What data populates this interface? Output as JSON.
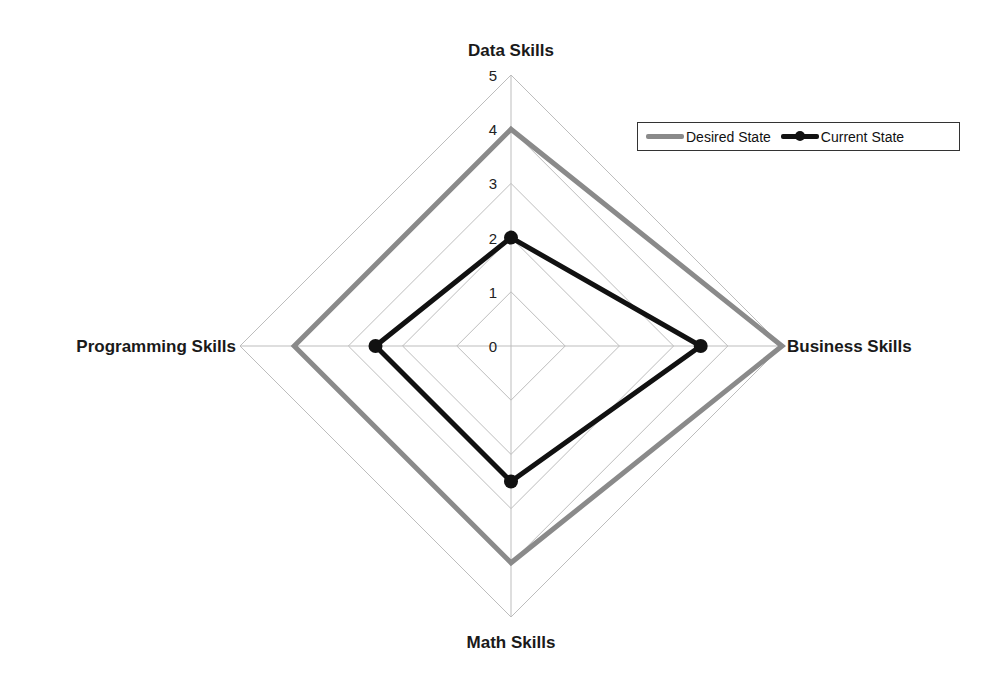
{
  "chart_data": {
    "type": "radar",
    "title": "",
    "categories": [
      "Data Skills",
      "Business Skills",
      "Math Skills",
      "Programming Skills"
    ],
    "series": [
      {
        "name": "Desired State",
        "values": [
          4,
          5,
          4,
          4
        ],
        "color": "#8a8a8a",
        "marker": false
      },
      {
        "name": "Current State",
        "values": [
          2,
          3.5,
          2.5,
          2.5
        ],
        "color": "#111111",
        "marker": true
      }
    ],
    "rlim": [
      0,
      5
    ],
    "ticks": [
      "0",
      "1",
      "2",
      "3",
      "4",
      "5"
    ],
    "grid": true,
    "legend_position": "top-right"
  },
  "legend": {
    "items": [
      {
        "label": "Desired State"
      },
      {
        "label": "Current State"
      }
    ]
  }
}
